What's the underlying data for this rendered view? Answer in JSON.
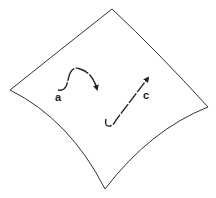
{
  "diagram": {
    "type": "curved surface with curves",
    "surface": {
      "stroke": "#333333"
    },
    "curves": [
      {
        "label": "a",
        "description": "S-shaped curve with arrow"
      },
      {
        "label": "c",
        "description": "hooked line with arrow pointing up-right"
      }
    ]
  }
}
